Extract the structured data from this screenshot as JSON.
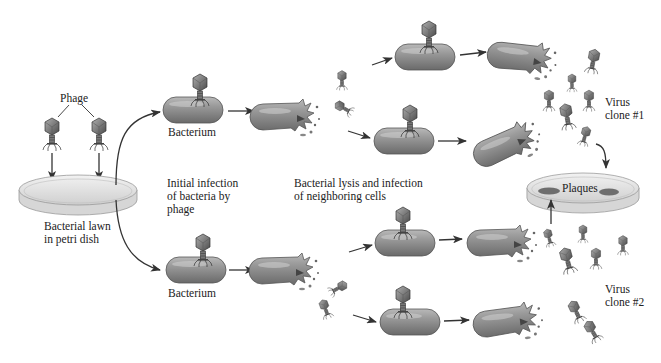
{
  "diagram": {
    "colors": {
      "background": "#ffffff",
      "bacterium": "#8c8c8c",
      "arrow": "#333333",
      "dish": "#dcdcdc",
      "plaque": "#6e6e6e",
      "text": "#222222"
    },
    "labels": {
      "phage": "Phage",
      "lawn_line1": "Bacterial lawn",
      "lawn_line2": "in petri dish",
      "bacterium_top": "Bacterium",
      "bacterium_bottom": "Bacterium",
      "initial_line1": "Initial infection",
      "initial_line2": "of bacteria by",
      "initial_line3": "phage",
      "lysis_line1": "Bacterial lysis and infection",
      "lysis_line2": "of neighboring cells",
      "plaques": "Plaques",
      "clone1_line1": "Virus",
      "clone1_line2": "clone #1",
      "clone2_line1": "Virus",
      "clone2_line2": "clone #2"
    },
    "nodes": [
      {
        "id": "phage-1",
        "type": "phage"
      },
      {
        "id": "phage-2",
        "type": "phage"
      },
      {
        "id": "petri-dish-lawn",
        "type": "dish"
      },
      {
        "id": "bacterium-top",
        "type": "infected-bacterium"
      },
      {
        "id": "bacterium-bottom",
        "type": "infected-bacterium"
      },
      {
        "id": "lysed-top",
        "type": "lysed-bacterium"
      },
      {
        "id": "lysed-bottom",
        "type": "lysed-bacterium"
      },
      {
        "id": "petri-dish-plaques",
        "type": "dish"
      }
    ]
  }
}
